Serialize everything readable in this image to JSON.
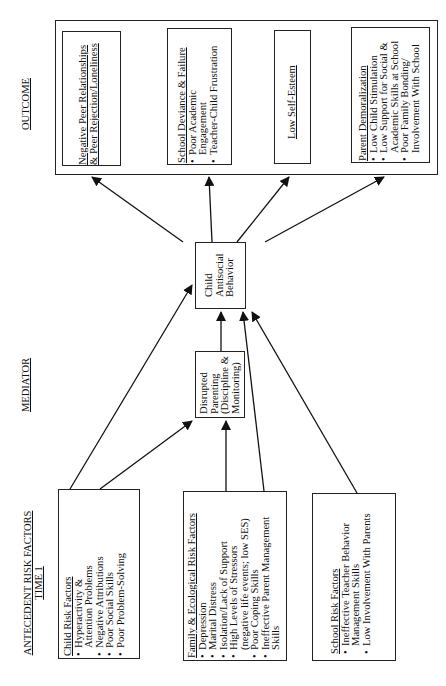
{
  "section_labels": {
    "outcome": "OUTCOME",
    "mediator": "MEDIATOR",
    "antecedent_line1": "ANTECEDENT RISK FACTORS",
    "antecedent_line2": "TIME 1"
  },
  "outcomes": {
    "peer": {
      "title_line1": "Negative Peer Relationships",
      "title_line2": "& Peer Rejection/Loneliness"
    },
    "school": {
      "title": "School Deviance & Failure",
      "items": [
        "Poor Academic",
        "Engagement",
        "Teacher-Child Frustration"
      ]
    },
    "esteem": {
      "title": "Low Self-Esteem"
    },
    "parent": {
      "title": "Parent Demoralization",
      "items": [
        "Low Child Stimulation",
        "Low Support for Social &",
        "Academic Skills at School",
        "Poor Family Bonding/",
        "Involvement With School"
      ]
    }
  },
  "mediators": {
    "child_antisocial": [
      "Child",
      "Antisocial",
      "Behavior"
    ],
    "disrupted_parenting": [
      "Disrupted",
      "Parenting",
      "(Discipline &",
      "Monitoring)"
    ]
  },
  "risk_factors": {
    "child": {
      "title": "Child Risk Factors",
      "items": [
        "Hyperactivity &",
        "Attention Problems",
        "Negative Attributions",
        "Poor Social Skills",
        "Poor Problem-Solving"
      ]
    },
    "family": {
      "title": "Family & Ecological Risk Factors",
      "items": [
        "Depression",
        "Marital Distress",
        "Isolation/Lack of Support",
        "High Levels of Stressors",
        "(negative life events; low SES)",
        "Poor Coping Skills",
        "Ineffective Parent Management",
        "Skills"
      ]
    },
    "school": {
      "title": "School Risk Factors",
      "items": [
        "Ineffective Teacher Behavior",
        "Management Skills",
        "Low Involvement With Parents"
      ]
    }
  }
}
